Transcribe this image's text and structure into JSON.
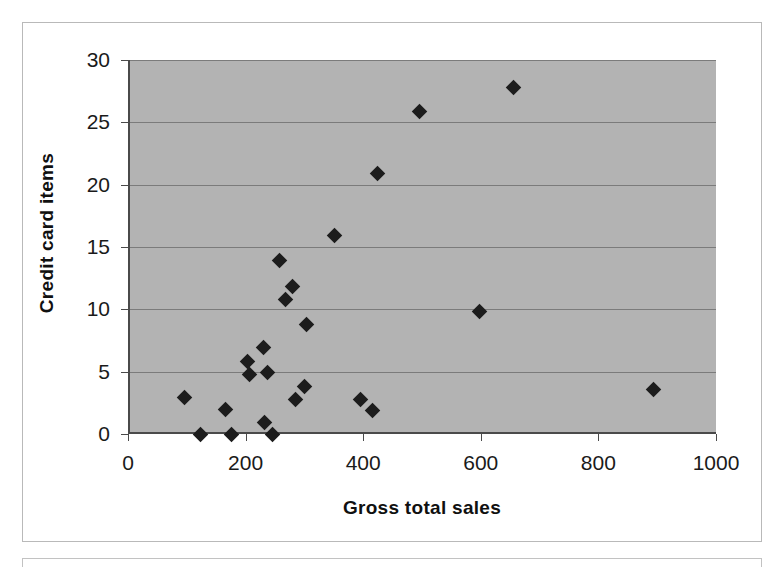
{
  "chart_data": {
    "type": "scatter",
    "title": "",
    "xlabel": "Gross total sales",
    "ylabel": "Credit card items",
    "xlim": [
      0,
      1000
    ],
    "ylim": [
      0,
      30
    ],
    "xticks": [
      0,
      200,
      400,
      600,
      800,
      1000
    ],
    "yticks": [
      0,
      5,
      10,
      15,
      20,
      25,
      30
    ],
    "xtick_labels": [
      "0",
      "200",
      "400",
      "600",
      "800",
      "1000"
    ],
    "ytick_labels": [
      "0",
      "5",
      "10",
      "15",
      "20",
      "25",
      "30"
    ],
    "grid": "horizontal",
    "legend": "none",
    "marker": "diamond",
    "marker_color": "#1c1c1c",
    "plot_background_color": "#b3b3b3",
    "gridline_color": "#7b7b7b",
    "axis_color": "#4a4a4a",
    "page_background_color": "#ffffff",
    "series": [
      {
        "name": "Customers",
        "points": [
          {
            "x": 92,
            "y": 2.9
          },
          {
            "x": 120,
            "y": 0.0
          },
          {
            "x": 163,
            "y": 2.0
          },
          {
            "x": 172,
            "y": 0.0
          },
          {
            "x": 200,
            "y": 5.8
          },
          {
            "x": 203,
            "y": 4.8
          },
          {
            "x": 227,
            "y": 6.9
          },
          {
            "x": 228,
            "y": 0.9
          },
          {
            "x": 233,
            "y": 4.9
          },
          {
            "x": 243,
            "y": 0.0
          },
          {
            "x": 254,
            "y": 13.9
          },
          {
            "x": 264,
            "y": 10.8
          },
          {
            "x": 277,
            "y": 11.8
          },
          {
            "x": 282,
            "y": 2.8
          },
          {
            "x": 296,
            "y": 3.8
          },
          {
            "x": 300,
            "y": 8.8
          },
          {
            "x": 347,
            "y": 15.9
          },
          {
            "x": 392,
            "y": 2.8
          },
          {
            "x": 412,
            "y": 1.9
          },
          {
            "x": 421,
            "y": 20.9
          },
          {
            "x": 492,
            "y": 25.9
          },
          {
            "x": 595,
            "y": 9.8
          },
          {
            "x": 653,
            "y": 27.8
          },
          {
            "x": 890,
            "y": 3.6
          }
        ]
      }
    ]
  }
}
